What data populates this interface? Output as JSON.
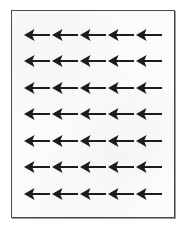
{
  "figure": {
    "style": "scanned black-and-white line art",
    "panel": {
      "background_color": "#fcfcfa",
      "border_color": "#4a4a48",
      "border_width_px": 1,
      "shadow_color": "#9a9a98"
    },
    "page_background_color": "#ffffff"
  },
  "grid": {
    "rows": 7,
    "columns": 5,
    "total_arrows": 35,
    "row_spacing_px": 28,
    "column_spacing_px": 28,
    "uniform": true
  },
  "arrow": {
    "icon_name": "arrow-left-icon",
    "direction": "left",
    "color": "#1c1c1c",
    "head_shape": "barbed-triangle",
    "tail_shape": "straight-bar",
    "width_px": 28,
    "height_px": 14,
    "label": "left arrow"
  },
  "rows": [
    {
      "index": 1,
      "label": "arrow row 1",
      "arrows": [
        "left",
        "left",
        "left",
        "left",
        "left"
      ]
    },
    {
      "index": 2,
      "label": "arrow row 2",
      "arrows": [
        "left",
        "left",
        "left",
        "left",
        "left"
      ]
    },
    {
      "index": 3,
      "label": "arrow row 3",
      "arrows": [
        "left",
        "left",
        "left",
        "left",
        "left"
      ]
    },
    {
      "index": 4,
      "label": "arrow row 4",
      "arrows": [
        "left",
        "left",
        "left",
        "left",
        "left"
      ]
    },
    {
      "index": 5,
      "label": "arrow row 5",
      "arrows": [
        "left",
        "left",
        "left",
        "left",
        "left"
      ]
    },
    {
      "index": 6,
      "label": "arrow row 6",
      "arrows": [
        "left",
        "left",
        "left",
        "left",
        "left"
      ]
    },
    {
      "index": 7,
      "label": "arrow row 7",
      "arrows": [
        "left",
        "left",
        "left",
        "left",
        "left"
      ]
    }
  ]
}
